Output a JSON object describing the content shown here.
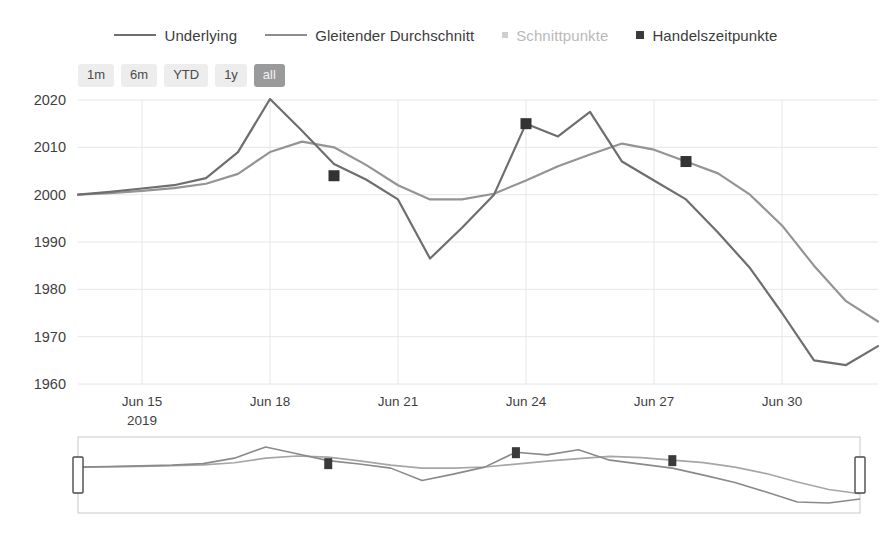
{
  "legend": {
    "items": [
      {
        "label": "Underlying",
        "marker": "line-icon",
        "color": "#6e6e6e",
        "faint": false
      },
      {
        "label": "Gleitender Durchschnitt",
        "marker": "line-icon",
        "color": "#8d8d8d",
        "faint": false
      },
      {
        "label": "Schnittpunkte",
        "marker": "square-icon",
        "color": "#cfcfcf",
        "faint": true
      },
      {
        "label": "Handelszeitpunkte",
        "marker": "square-icon",
        "color": "#3a3a3a",
        "faint": false
      }
    ]
  },
  "range_selector": {
    "buttons": [
      {
        "label": "1m",
        "selected": false
      },
      {
        "label": "6m",
        "selected": false
      },
      {
        "label": "YTD",
        "selected": false
      },
      {
        "label": "1y",
        "selected": false
      },
      {
        "label": "all",
        "selected": true
      }
    ]
  },
  "navigator": {
    "left_handle": "nav-handle-left",
    "right_handle": "nav-handle-right",
    "selection_start": "0%",
    "selection_end": "100%"
  },
  "chart_data": {
    "type": "line",
    "title": "",
    "xlabel": "",
    "ylabel": "",
    "grid": true,
    "legend_position": "top",
    "ylim": [
      1960,
      2020
    ],
    "yticks": [
      1960,
      1970,
      1980,
      1990,
      2000,
      2010,
      2020
    ],
    "xtick_labels": [
      "Jun 15",
      "Jun 18",
      "Jun 21",
      "Jun 24",
      "Jun 27",
      "Jun 30"
    ],
    "xtick_sublabel": "2019",
    "xtick_indices": [
      2,
      6,
      10,
      14,
      18,
      22
    ],
    "x": [
      0,
      1,
      2,
      3,
      4,
      5,
      6,
      7,
      8,
      9,
      10,
      11,
      12,
      13,
      14,
      15,
      16,
      17,
      18,
      19,
      20,
      21,
      22,
      23,
      24,
      25
    ],
    "series": [
      {
        "name": "Underlying",
        "color": "#6e6e6e",
        "values": [
          2000.0,
          2000.6,
          2001.3,
          2002.0,
          2003.5,
          2009.0,
          2020.2,
          2013.5,
          2006.5,
          2003.2,
          1999.0,
          1986.5,
          1993.0,
          2000.0,
          2015.0,
          2012.3,
          2017.5,
          2007.0,
          2003.0,
          1999.0,
          1992.0,
          1984.5,
          1975.0,
          1965.0,
          1964.0,
          1968.0
        ]
      },
      {
        "name": "Gleitender Durchschnitt",
        "color": "#949494",
        "values": [
          2000.0,
          2000.3,
          2000.8,
          2001.4,
          2002.3,
          2004.4,
          2009.0,
          2011.2,
          2010.0,
          2006.3,
          2002.0,
          1999.0,
          1999.0,
          2000.2,
          2003.0,
          2006.0,
          2008.5,
          2010.8,
          2009.5,
          2007.0,
          2004.5,
          2000.0,
          1993.5,
          1985.0,
          1977.5,
          1973.2
        ]
      }
    ],
    "trade_points": [
      {
        "x": 8,
        "y": 2004.0,
        "label": "Handelszeitpunkt"
      },
      {
        "x": 14,
        "y": 2015.0,
        "label": "Handelszeitpunkt"
      },
      {
        "x": 19,
        "y": 2007.0,
        "label": "Handelszeitpunkt"
      }
    ],
    "crossing_points": []
  }
}
